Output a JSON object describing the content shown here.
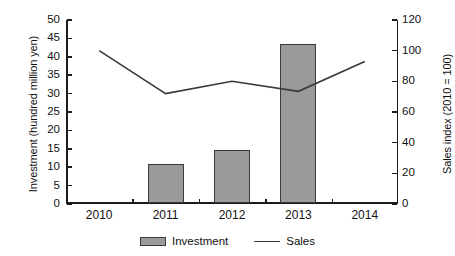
{
  "chart_data": {
    "type": "bar",
    "title": "",
    "subtitle": "",
    "categories": [
      "2010",
      "2011",
      "2012",
      "2013",
      "2014"
    ],
    "xlabel": "",
    "ylabel": "Investment (hundred million yen)",
    "y2label": "Sales index (2010 = 100)",
    "ylim": [
      0,
      50
    ],
    "y2lim": [
      0,
      120
    ],
    "yticks": [
      "50",
      "45",
      "40",
      "35",
      "30",
      "25",
      "20",
      "15",
      "10",
      "5",
      "0"
    ],
    "ytick_values": [
      50,
      45,
      40,
      35,
      30,
      25,
      20,
      15,
      10,
      5,
      0
    ],
    "y2ticks": [
      "120",
      "100",
      "80",
      "60",
      "40",
      "20",
      "0"
    ],
    "y2tick_values": [
      120,
      100,
      80,
      60,
      40,
      20,
      0
    ],
    "grid": false,
    "legend_position": "bottom",
    "series": [
      {
        "name": "Investment",
        "type": "bar",
        "axis": "left",
        "units": "hundred million yen",
        "color": "#9a9a9a",
        "edge_color": "#3a3a3a",
        "values": [
          0,
          10.7,
          14.3,
          43.1,
          0
        ]
      },
      {
        "name": "Sales",
        "type": "line",
        "axis": "right",
        "units": "index (2010 = 100)",
        "color": "#3a3a3a",
        "values": [
          100,
          72,
          80,
          73.5,
          93
        ]
      }
    ]
  },
  "axes": {
    "left_title": "Investment (hundred million yen)",
    "right_title": "Sales index (2010 = 100)"
  },
  "legend": {
    "items": [
      {
        "label": "Investment",
        "marker": "bar-swatch"
      },
      {
        "label": "Sales",
        "marker": "line-swatch"
      }
    ]
  }
}
